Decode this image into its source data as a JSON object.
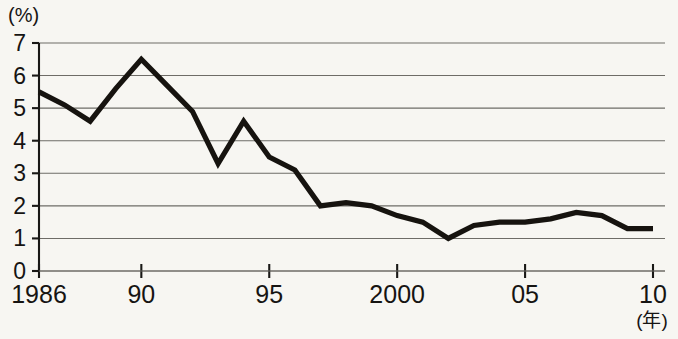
{
  "chart_data": {
    "type": "line",
    "title": "",
    "subtitle": "",
    "xlabel": "(年)",
    "ylabel": "(%)",
    "ylim": [
      0,
      7
    ],
    "xlim": [
      1986,
      2010
    ],
    "grid": true,
    "legend": null,
    "y_ticks": [
      "7",
      "6",
      "5",
      "4",
      "3",
      "2",
      "1",
      "0"
    ],
    "y_tick_values": [
      7,
      6,
      5,
      4,
      3,
      2,
      1,
      0
    ],
    "x_ticks": [
      "1986",
      "90",
      "95",
      "2000",
      "05",
      "10"
    ],
    "x_tick_values": [
      1986,
      1990,
      1995,
      2000,
      2005,
      2010
    ],
    "x": [
      1986,
      1987,
      1988,
      1989,
      1990,
      1991,
      1992,
      1993,
      1994,
      1995,
      1996,
      1997,
      1998,
      1999,
      2000,
      2001,
      2002,
      2003,
      2004,
      2005,
      2006,
      2007,
      2008,
      2009,
      2010
    ],
    "series": [
      {
        "name": "",
        "color": "#16130f",
        "values": [
          5.5,
          5.1,
          4.6,
          5.6,
          6.5,
          5.7,
          4.9,
          3.3,
          4.6,
          3.5,
          3.1,
          2.0,
          2.1,
          2.0,
          1.7,
          1.5,
          1.0,
          1.4,
          1.5,
          1.5,
          1.6,
          1.8,
          1.7,
          1.3,
          1.3
        ]
      }
    ]
  },
  "axis": {
    "y_unit_label": "(%)",
    "x_unit_label": "(年)"
  },
  "colors": {
    "line": "#16130f",
    "grid": "#6e6c67",
    "axis": "#191816",
    "background": "#f7f6f2",
    "text": "#161412"
  }
}
